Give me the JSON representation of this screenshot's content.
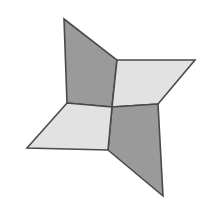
{
  "figure": {
    "canvas": {
      "width": 210,
      "height": 224
    },
    "background_color": "#ffffff",
    "stroke_color": "#4a4a4a",
    "stroke_width": 1.6,
    "fill_dark": "#9a9a9a",
    "fill_light": "#e2e2e2",
    "center": {
      "x": 112,
      "y": 107
    },
    "blade_count": 4,
    "blades": [
      {
        "name": "blade-top-left",
        "shade": "dark",
        "fill": "#9a9a9a",
        "tip": {
          "x": 64,
          "y": 19
        },
        "points": "64,19 117,60 112,107 67,103"
      },
      {
        "name": "blade-right",
        "shade": "light",
        "fill": "#e2e2e2",
        "tip": {
          "x": 195,
          "y": 60
        },
        "points": "195,60 158,104 112,107 117,60"
      },
      {
        "name": "blade-bottom-right",
        "shade": "dark",
        "fill": "#9a9a9a",
        "tip": {
          "x": 163,
          "y": 196
        },
        "points": "163,196 108,150 112,107 158,104"
      },
      {
        "name": "blade-bottom-left",
        "shade": "light",
        "fill": "#e2e2e2",
        "tip": {
          "x": 27,
          "y": 148
        },
        "points": "27,148 67,103 112,107 108,150"
      }
    ]
  }
}
